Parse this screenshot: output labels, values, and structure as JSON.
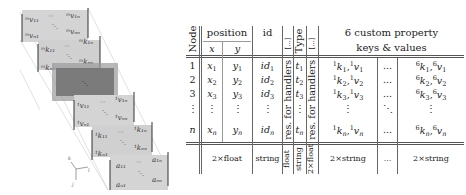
{
  "diagram": {
    "left_stack": {
      "layers": [
        {
          "name": "m-v-matrix",
          "corners": {
            "top_left": "m v 11",
            "top_right": "m v 1n",
            "bottom_left": "m v n1",
            "bottom_right": "m v nn"
          }
        },
        {
          "name": "m-k-matrix",
          "corners": {
            "top_left": "m k 11",
            "top_right": "m k 1n",
            "bottom_left": "m k n1",
            "bottom_right": "m k nn"
          }
        },
        {
          "name": "highlighted-layer",
          "corners": {}
        },
        {
          "name": "1-v-matrix",
          "corners": {
            "top_left": "1 v 11",
            "top_right": "1 v 1n",
            "bottom_left": "1 v n1",
            "bottom_right": "1 v nn"
          }
        },
        {
          "name": "1-k-matrix",
          "corners": {
            "top_left": "1 k 11",
            "top_right": "1 k 1n",
            "bottom_left": "1 k n1",
            "bottom_right": "1 k nn"
          }
        },
        {
          "name": "a-matrix",
          "corners": {
            "top_left": "a11",
            "top_right": "a1n",
            "bottom_left": "an1",
            "bottom_right": "ann"
          }
        }
      ],
      "axes_labels": [
        "k",
        "l",
        "j"
      ]
    },
    "table": {
      "headers": {
        "node": "Node",
        "position": "position",
        "x": "x",
        "y": "y",
        "id": "id",
        "res1": "[...]",
        "type": "Type",
        "res2": "[...]",
        "custom_line1": "6 custom property",
        "custom_line2": "keys & values"
      },
      "rows": [
        {
          "node": "1",
          "x": "1",
          "y": "1",
          "id": "1",
          "t": "1",
          "k1": "1",
          "k6": "1"
        },
        {
          "node": "2",
          "x": "2",
          "y": "2",
          "id": "2",
          "t": "2",
          "k1": "2",
          "k6": "2"
        },
        {
          "node": "3",
          "x": "3",
          "y": "3",
          "id": "3",
          "t": "3",
          "k1": "3",
          "k6": "3"
        },
        {
          "node": "⋮",
          "x": "⋮",
          "y": "⋮",
          "id": "⋮",
          "t": "⋮",
          "k1": "⋮",
          "dots": "⋱",
          "k6": "⋮"
        },
        {
          "node": "n",
          "x": "n",
          "y": "n",
          "id": "n",
          "t": "n",
          "k1": "n",
          "k6": "n"
        }
      ],
      "res_label": "res. for handlers",
      "dots_label": "...",
      "types": {
        "position": "2×float",
        "id": "string",
        "res1": "float",
        "type": "string",
        "res2": "2×float",
        "k1": "2×string",
        "dots": "...",
        "k6": "2×string"
      }
    }
  }
}
